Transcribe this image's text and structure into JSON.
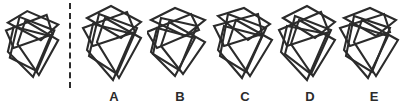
{
  "puzzle": {
    "type": "figure-matching-multiple-choice",
    "reference": {
      "name": "reference-figure",
      "description": "cluster of five overlapping quadrilaterals"
    },
    "divider": {
      "name": "dashed-divider",
      "style": "vertical dashed line",
      "color": "#2b2b2b"
    },
    "options": [
      {
        "id": "A",
        "label": "A"
      },
      {
        "id": "B",
        "label": "B"
      },
      {
        "id": "C",
        "label": "C"
      },
      {
        "id": "D",
        "label": "D"
      },
      {
        "id": "E",
        "label": "E"
      }
    ],
    "colors": {
      "background": "#ffffff",
      "stroke": "#2b2b2b",
      "label_text": "#2b2b2b"
    }
  },
  "chart_data": {
    "type": "table",
    "title": "",
    "figures": {
      "reference": [
        [
          [
            4,
            22
          ],
          [
            24,
            10
          ],
          [
            56,
            24
          ],
          [
            38,
            40
          ]
        ],
        [
          [
            2,
            30
          ],
          [
            44,
            14
          ],
          [
            50,
            34
          ],
          [
            10,
            48
          ]
        ],
        [
          [
            16,
            16
          ],
          [
            52,
            30
          ],
          [
            34,
            72
          ],
          [
            6,
            58
          ]
        ],
        [
          [
            10,
            26
          ],
          [
            48,
            36
          ],
          [
            30,
            78
          ],
          [
            4,
            52
          ]
        ],
        [
          [
            22,
            20
          ],
          [
            56,
            40
          ],
          [
            36,
            76
          ],
          [
            14,
            44
          ]
        ]
      ],
      "A": [
        [
          [
            6,
            18
          ],
          [
            30,
            6
          ],
          [
            60,
            22
          ],
          [
            40,
            38
          ]
        ],
        [
          [
            2,
            28
          ],
          [
            46,
            12
          ],
          [
            54,
            32
          ],
          [
            12,
            46
          ]
        ],
        [
          [
            18,
            14
          ],
          [
            56,
            28
          ],
          [
            36,
            74
          ],
          [
            8,
            56
          ]
        ],
        [
          [
            12,
            24
          ],
          [
            52,
            34
          ],
          [
            32,
            80
          ],
          [
            6,
            50
          ]
        ],
        [
          [
            24,
            18
          ],
          [
            60,
            38
          ],
          [
            38,
            78
          ],
          [
            16,
            42
          ]
        ]
      ],
      "B": [
        [
          [
            4,
            20
          ],
          [
            28,
            8
          ],
          [
            58,
            20
          ],
          [
            38,
            36
          ]
        ],
        [
          [
            0,
            32
          ],
          [
            44,
            14
          ],
          [
            52,
            30
          ],
          [
            10,
            48
          ]
        ],
        [
          [
            14,
            18
          ],
          [
            50,
            26
          ],
          [
            32,
            70
          ],
          [
            6,
            54
          ]
        ],
        [
          [
            10,
            28
          ],
          [
            48,
            38
          ],
          [
            28,
            76
          ],
          [
            4,
            52
          ]
        ],
        [
          [
            22,
            22
          ],
          [
            58,
            42
          ],
          [
            36,
            74
          ],
          [
            14,
            46
          ]
        ]
      ],
      "C": [
        [
          [
            6,
            16
          ],
          [
            32,
            8
          ],
          [
            58,
            24
          ],
          [
            36,
            40
          ]
        ],
        [
          [
            2,
            26
          ],
          [
            46,
            14
          ],
          [
            50,
            34
          ],
          [
            12,
            46
          ]
        ],
        [
          [
            16,
            14
          ],
          [
            54,
            28
          ],
          [
            34,
            72
          ],
          [
            8,
            56
          ]
        ],
        [
          [
            12,
            26
          ],
          [
            50,
            36
          ],
          [
            30,
            78
          ],
          [
            6,
            50
          ]
        ],
        [
          [
            24,
            20
          ],
          [
            60,
            40
          ],
          [
            38,
            76
          ],
          [
            16,
            44
          ]
        ]
      ],
      "D": [
        [
          [
            6,
            18
          ],
          [
            30,
            6
          ],
          [
            58,
            22
          ],
          [
            38,
            38
          ]
        ],
        [
          [
            2,
            30
          ],
          [
            44,
            12
          ],
          [
            52,
            32
          ],
          [
            10,
            46
          ]
        ],
        [
          [
            18,
            16
          ],
          [
            54,
            30
          ],
          [
            34,
            74
          ],
          [
            8,
            54
          ]
        ],
        [
          [
            10,
            26
          ],
          [
            50,
            34
          ],
          [
            30,
            80
          ],
          [
            4,
            52
          ]
        ],
        [
          [
            22,
            20
          ],
          [
            58,
            40
          ],
          [
            36,
            76
          ],
          [
            14,
            44
          ]
        ]
      ],
      "E": [
        [
          [
            6,
            18
          ],
          [
            32,
            8
          ],
          [
            58,
            20
          ],
          [
            38,
            36
          ]
        ],
        [
          [
            2,
            28
          ],
          [
            46,
            14
          ],
          [
            52,
            32
          ],
          [
            12,
            46
          ]
        ],
        [
          [
            16,
            16
          ],
          [
            52,
            28
          ],
          [
            34,
            72
          ],
          [
            8,
            56
          ]
        ],
        [
          [
            12,
            24
          ],
          [
            50,
            36
          ],
          [
            30,
            78
          ],
          [
            6,
            50
          ]
        ],
        [
          [
            24,
            20
          ],
          [
            60,
            40
          ],
          [
            38,
            76
          ],
          [
            16,
            42
          ]
        ]
      ]
    },
    "labels": [
      "A",
      "B",
      "C",
      "D",
      "E"
    ]
  }
}
